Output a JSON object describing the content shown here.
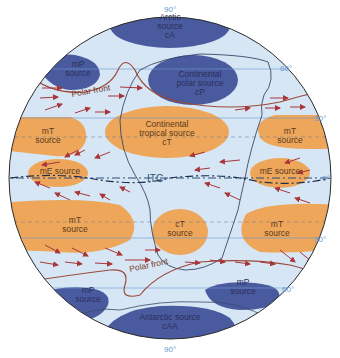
{
  "diagram": {
    "colors": {
      "ocean_bg": "#d6e6f5",
      "cold_source": "#4a5a9e",
      "warm_source": "#eda65a",
      "wind_arrow": "#a8363a",
      "front_line": "#9a4a3a",
      "land_outline": "#3a4a6a",
      "latitude_label": "#6a9ad0"
    },
    "latitudes": {
      "top_pole": "90°",
      "n60": "60°",
      "n30": "30°",
      "equator": "0°",
      "s30": "30°",
      "s60": "60°",
      "bottom_pole": "90°"
    },
    "air_masses": {
      "arctic": {
        "line1": "Arctic",
        "line2": "source",
        "line3": "cA"
      },
      "mp_north": {
        "line1": "mP",
        "line2": "source"
      },
      "cp": {
        "line1": "Continental",
        "line2": "polar source",
        "line3": "cP"
      },
      "mt_nw": {
        "line1": "mT",
        "line2": "source"
      },
      "ct_north": {
        "line1": "Continental",
        "line2": "tropical source",
        "line3": "cT"
      },
      "mt_ne": {
        "line1": "mT",
        "line2": "source"
      },
      "me_west": {
        "line1": "mE source"
      },
      "me_east": {
        "line1": "mE source"
      },
      "mt_sw": {
        "line1": "mT",
        "line2": "source"
      },
      "ct_south": {
        "line1": "cT",
        "line2": "source"
      },
      "mt_se": {
        "line1": "mT",
        "line2": "source"
      },
      "mp_sw": {
        "line1": "mP",
        "line2": "source"
      },
      "mp_se": {
        "line1": "mP",
        "line2": "source"
      },
      "antarctic": {
        "line1": "Antarctic source",
        "line2": "cAA"
      }
    },
    "fronts": {
      "north": "Polar front",
      "south": "Polar front",
      "itc": "ITC"
    }
  }
}
